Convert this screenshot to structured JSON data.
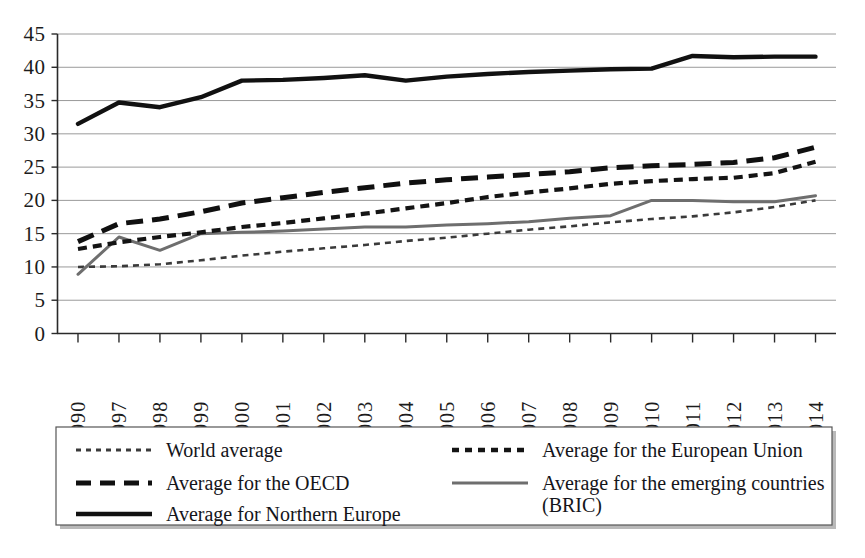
{
  "chart_data": {
    "type": "line",
    "title": "",
    "subtitle": "",
    "xlabel": "",
    "ylabel": "",
    "ylim": [
      0,
      45
    ],
    "ytick_values": [
      0,
      5,
      10,
      15,
      20,
      25,
      30,
      35,
      40,
      45
    ],
    "ytick_labels": [
      "0",
      "5",
      "10",
      "15",
      "20",
      "25",
      "30",
      "35",
      "40",
      "45"
    ],
    "grid": true,
    "grid_axis": "y",
    "legend_position": "bottom",
    "categories": [
      "1990",
      "1997",
      "1998",
      "1999",
      "2000",
      "2001",
      "2002",
      "2003",
      "2004",
      "2005",
      "2006",
      "2007",
      "2008",
      "2009",
      "2010",
      "2011",
      "2012",
      "2013",
      "2014"
    ],
    "series": [
      {
        "name": "World average",
        "style": "fine-dotted",
        "color": "#3a3a3a",
        "values": [
          10.0,
          10.1,
          10.4,
          11.0,
          11.7,
          12.3,
          12.8,
          13.3,
          13.9,
          14.4,
          15.0,
          15.6,
          16.1,
          16.7,
          17.2,
          17.6,
          18.2,
          19.0,
          20.0
        ]
      },
      {
        "name": "Average for the European Union",
        "style": "dashed",
        "color": "#141414",
        "values": [
          12.7,
          13.7,
          14.5,
          15.2,
          16.0,
          16.6,
          17.3,
          18.0,
          18.8,
          19.6,
          20.5,
          21.2,
          21.8,
          22.5,
          22.9,
          23.2,
          23.4,
          24.1,
          25.8
        ]
      },
      {
        "name": "Average for the OECD",
        "style": "long-dashed",
        "color": "#101010",
        "values": [
          13.8,
          16.5,
          17.2,
          18.3,
          19.6,
          20.4,
          21.2,
          21.9,
          22.6,
          23.1,
          23.5,
          23.9,
          24.3,
          24.9,
          25.2,
          25.4,
          25.7,
          26.4,
          28.0
        ]
      },
      {
        "name": "Average for Northern Europe",
        "style": "solid",
        "color": "#111111",
        "values": [
          31.5,
          34.7,
          34.0,
          35.5,
          38.0,
          38.1,
          38.4,
          38.8,
          38.0,
          38.6,
          39.0,
          39.3,
          39.5,
          39.7,
          39.8,
          41.7,
          41.5,
          41.6,
          41.6
        ]
      },
      {
        "name": "Average for the emerging countries (BRIC)",
        "style": "solid-gray",
        "color": "#6e6e6e",
        "values": [
          8.9,
          14.5,
          12.5,
          15.0,
          15.2,
          15.4,
          15.7,
          16.0,
          16.0,
          16.3,
          16.5,
          16.8,
          17.3,
          17.7,
          20.0,
          20.0,
          19.8,
          19.8,
          20.7
        ]
      }
    ]
  },
  "legend": {
    "entries": [
      {
        "label": "World average",
        "swatch": "world-dotted-swatch"
      },
      {
        "label": "Average for the European Union",
        "swatch": "eu-dashed-swatch"
      },
      {
        "label": "Average for the OECD",
        "swatch": "oecd-long-dashed-swatch"
      },
      {
        "label": "Average for the emerging countries",
        "label2": "(BRIC)",
        "swatch": "bric-solid-swatch"
      },
      {
        "label": "Average for Northern Europe",
        "swatch": "northern-solid-swatch"
      }
    ]
  },
  "axes": {
    "y": {
      "labels": [
        "45",
        "40",
        "35",
        "30",
        "25",
        "20",
        "15",
        "10",
        "5",
        "0"
      ]
    },
    "x": {
      "labels": [
        "1990",
        "1997",
        "1998",
        "1999",
        "2000",
        "2001",
        "2002",
        "2003",
        "2004",
        "2005",
        "2006",
        "2007",
        "2008",
        "2009",
        "2010",
        "2011",
        "2012",
        "2013",
        "2014"
      ]
    }
  },
  "colors": {
    "gridline": "#9a9a9a",
    "axis": "#2a2a2a",
    "world": "#3a3a3a",
    "european_union": "#141414",
    "oecd": "#101010",
    "northern_europe": "#111111",
    "bric": "#6e6e6e",
    "legend_border": "#555555",
    "background": "#ffffff"
  }
}
